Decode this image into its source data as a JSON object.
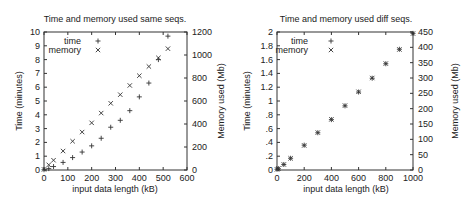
{
  "chart_data": [
    {
      "type": "scatter",
      "title": "Time and memory used same seqs.",
      "xlabel": "input data length (kB)",
      "ylabel": "Time (minutes)",
      "y2label": "Memory used (Mb)",
      "xlim": [
        0,
        600
      ],
      "ylim": [
        0,
        10
      ],
      "y2lim": [
        0,
        1200
      ],
      "xticks": [
        0,
        100,
        200,
        300,
        400,
        500,
        600
      ],
      "yticks": [
        0,
        1,
        2,
        3,
        4,
        5,
        6,
        7,
        8,
        9,
        10
      ],
      "y2ticks": [
        0,
        200,
        400,
        600,
        800,
        1000,
        1200
      ],
      "grid": false,
      "legend_position": "top-left",
      "series": [
        {
          "name": "time",
          "marker": "+",
          "axis": "y",
          "x": [
            0,
            20,
            40,
            80,
            120,
            160,
            200,
            240,
            280,
            320,
            360,
            400,
            440,
            480,
            520
          ],
          "y": [
            0.02,
            0.1,
            0.25,
            0.55,
            0.9,
            1.3,
            1.75,
            2.3,
            3.1,
            3.6,
            4.3,
            5.3,
            6.3,
            8.0,
            9.7
          ]
        },
        {
          "name": "memory",
          "marker": "x",
          "axis": "y2",
          "x": [
            0,
            20,
            40,
            80,
            120,
            160,
            200,
            240,
            280,
            320,
            360,
            400,
            440,
            480,
            520
          ],
          "y": [
            5,
            45,
            85,
            165,
            250,
            330,
            410,
            495,
            580,
            655,
            735,
            820,
            900,
            975,
            1055
          ]
        }
      ]
    },
    {
      "type": "scatter",
      "title": "Time and memory used diff seqs.",
      "xlabel": "input data length (kB)",
      "ylabel": "Time (minutes)",
      "y2label": "Memory used (Mb)",
      "xlim": [
        0,
        1000
      ],
      "ylim": [
        0,
        2
      ],
      "y2lim": [
        0,
        450
      ],
      "xticks": [
        0,
        200,
        400,
        600,
        800,
        1000
      ],
      "yticks": [
        0,
        0.2,
        0.4,
        0.6,
        0.8,
        1,
        1.2,
        1.4,
        1.6,
        1.8,
        2
      ],
      "y2ticks": [
        0,
        50,
        100,
        150,
        200,
        250,
        300,
        350,
        400,
        450
      ],
      "grid": false,
      "legend_position": "top-left",
      "series": [
        {
          "name": "time",
          "marker": "+",
          "axis": "y",
          "x": [
            0,
            10,
            50,
            100,
            200,
            300,
            400,
            500,
            600,
            700,
            800,
            900,
            1000
          ],
          "y": [
            0.01,
            0.02,
            0.08,
            0.17,
            0.36,
            0.54,
            0.73,
            0.93,
            1.13,
            1.33,
            1.54,
            1.75,
            1.98
          ]
        },
        {
          "name": "memory",
          "marker": "x",
          "axis": "y2",
          "x": [
            0,
            10,
            50,
            100,
            200,
            300,
            400,
            500,
            600,
            700,
            800,
            900,
            1000
          ],
          "y": [
            2,
            5,
            18,
            38,
            80,
            122,
            165,
            210,
            255,
            300,
            347,
            393,
            445
          ]
        }
      ]
    }
  ]
}
